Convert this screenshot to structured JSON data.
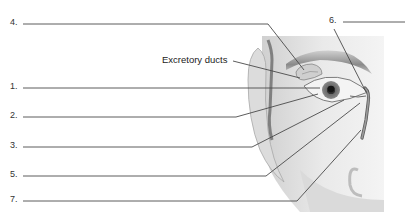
{
  "diagram": {
    "labels": [
      {
        "id": "1",
        "text": "1.",
        "answer": ""
      },
      {
        "id": "2",
        "text": "2.",
        "answer": ""
      },
      {
        "id": "3",
        "text": "3.",
        "answer": ""
      },
      {
        "id": "4",
        "text": "4.",
        "answer": ""
      },
      {
        "id": "5",
        "text": "5.",
        "answer": ""
      },
      {
        "id": "6",
        "text": "6.",
        "answer": ""
      },
      {
        "id": "7",
        "text": "7.",
        "answer": ""
      }
    ],
    "annotations": [
      {
        "text": "Excretory ducts"
      }
    ],
    "colors": {
      "line": "#4a4a4a",
      "skin_light": "#e8e8e8",
      "skin_shadow": "#9a9a9a",
      "iris": "#5a5a5a",
      "pupil": "#1a1a1a"
    }
  }
}
